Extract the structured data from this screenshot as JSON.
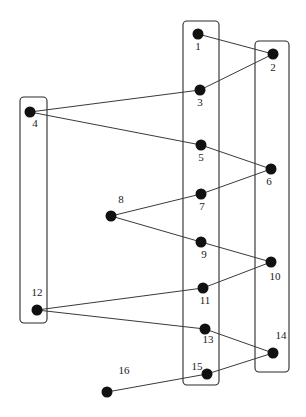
{
  "diagram": {
    "type": "graph-path-with-groups",
    "groups": [
      {
        "id": "left",
        "x": 20,
        "y": 97,
        "w": 27,
        "h": 226,
        "r": 4,
        "members": [
          4,
          12
        ]
      },
      {
        "id": "middle",
        "x": 183,
        "y": 21,
        "w": 36,
        "h": 364,
        "r": 4,
        "members": [
          1,
          3,
          5,
          7,
          9,
          11,
          13,
          15
        ]
      },
      {
        "id": "right",
        "x": 255,
        "y": 41,
        "w": 34,
        "h": 331,
        "r": 4,
        "members": [
          2,
          6,
          10,
          14
        ]
      }
    ],
    "nodes": [
      {
        "id": 1,
        "label": "1",
        "x": 198,
        "y": 34,
        "lx": 198,
        "ly": 50
      },
      {
        "id": 2,
        "label": "2",
        "x": 273,
        "y": 54,
        "lx": 273,
        "ly": 71
      },
      {
        "id": 3,
        "label": "3",
        "x": 200,
        "y": 90,
        "lx": 200,
        "ly": 106
      },
      {
        "id": 4,
        "label": "4",
        "x": 30,
        "y": 112,
        "lx": 35,
        "ly": 127
      },
      {
        "id": 5,
        "label": "5",
        "x": 201,
        "y": 145,
        "lx": 201,
        "ly": 161
      },
      {
        "id": 6,
        "label": "6",
        "x": 271,
        "y": 169,
        "lx": 269,
        "ly": 185
      },
      {
        "id": 7,
        "label": "7",
        "x": 201,
        "y": 194,
        "lx": 202,
        "ly": 210
      },
      {
        "id": 8,
        "label": "8",
        "x": 111,
        "y": 216,
        "lx": 121,
        "ly": 203
      },
      {
        "id": 9,
        "label": "9",
        "x": 201,
        "y": 242,
        "lx": 204,
        "ly": 258
      },
      {
        "id": 10,
        "label": "10",
        "x": 271,
        "y": 262,
        "lx": 275,
        "ly": 280
      },
      {
        "id": 11,
        "label": "11",
        "x": 203,
        "y": 288,
        "lx": 205,
        "ly": 304
      },
      {
        "id": 12,
        "label": "12",
        "x": 37,
        "y": 310,
        "lx": 37,
        "ly": 296
      },
      {
        "id": 13,
        "label": "13",
        "x": 205,
        "y": 329,
        "lx": 208,
        "ly": 343
      },
      {
        "id": 14,
        "label": "14",
        "x": 273,
        "y": 353,
        "lx": 281,
        "ly": 339
      },
      {
        "id": 15,
        "label": "15",
        "x": 207,
        "y": 374,
        "lx": 197,
        "ly": 370
      },
      {
        "id": 16,
        "label": "16",
        "x": 107,
        "y": 392,
        "lx": 124,
        "ly": 374
      }
    ],
    "edges": [
      [
        1,
        2
      ],
      [
        2,
        3
      ],
      [
        3,
        4
      ],
      [
        4,
        5
      ],
      [
        5,
        6
      ],
      [
        6,
        7
      ],
      [
        7,
        8
      ],
      [
        8,
        9
      ],
      [
        9,
        10
      ],
      [
        10,
        11
      ],
      [
        11,
        12
      ],
      [
        12,
        13
      ],
      [
        13,
        14
      ],
      [
        14,
        15
      ],
      [
        15,
        16
      ]
    ],
    "node_radius": 5.5,
    "colors": {
      "node": "#111111",
      "edge": "#3a3a3a",
      "box": "#2a2a2a",
      "background": "#ffffff"
    }
  }
}
